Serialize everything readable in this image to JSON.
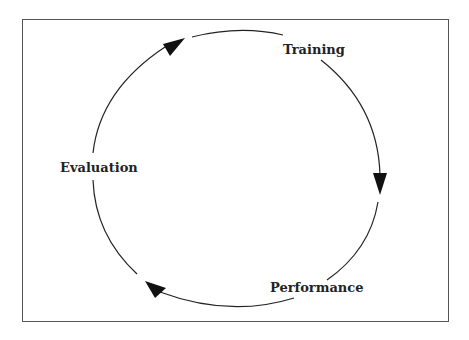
{
  "diagram": {
    "type": "cycle",
    "nodes": [
      {
        "id": "training",
        "label": "Training"
      },
      {
        "id": "performance",
        "label": "Performance"
      },
      {
        "id": "evaluation",
        "label": "Evaluation"
      }
    ],
    "edges": [
      {
        "from": "training",
        "to": "performance"
      },
      {
        "from": "performance",
        "to": "evaluation"
      },
      {
        "from": "evaluation",
        "to": "training"
      }
    ],
    "direction": "clockwise"
  }
}
